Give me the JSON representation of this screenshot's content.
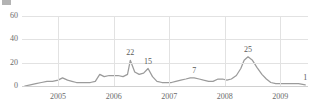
{
  "legend": {
    "label": "",
    "swatch_color": "#9a9a9a"
  },
  "chart_data": {
    "type": "line",
    "title": "",
    "subtitle": "",
    "xlabel": "",
    "ylabel": "",
    "grid": true,
    "legend_position": "top-left",
    "line_color": "#9b9b9b",
    "grid_color": "#e2e2e2",
    "background_color": "#ffffff",
    "ylim": [
      0,
      60
    ],
    "yticks": [
      0,
      20,
      40,
      60
    ],
    "ytick_labels": [
      "0",
      "20",
      "40",
      "60"
    ],
    "xlim": [
      2004.35,
      2009.5
    ],
    "xticks": [
      2005,
      2006,
      2007,
      2008,
      2009
    ],
    "xtick_labels": [
      "2005",
      "2006",
      "2007",
      "2008",
      "2009"
    ],
    "annotations": [
      {
        "label": "22",
        "x": 2006.3,
        "y": 22
      },
      {
        "label": "15",
        "x": 2006.62,
        "y": 15
      },
      {
        "label": "7",
        "x": 2007.45,
        "y": 7
      },
      {
        "label": "25",
        "x": 2008.42,
        "y": 25
      },
      {
        "label": "1",
        "x": 2009.45,
        "y": 1
      }
    ],
    "series": [
      {
        "name": "",
        "color": "#9b9b9b",
        "x": [
          2004.4,
          2004.5,
          2004.6,
          2004.7,
          2004.8,
          2004.9,
          2005.0,
          2005.08,
          2005.17,
          2005.25,
          2005.33,
          2005.42,
          2005.5,
          2005.58,
          2005.67,
          2005.75,
          2005.83,
          2005.92,
          2006.0,
          2006.08,
          2006.17,
          2006.25,
          2006.3,
          2006.38,
          2006.46,
          2006.54,
          2006.62,
          2006.7,
          2006.78,
          2006.87,
          2006.95,
          2007.04,
          2007.12,
          2007.21,
          2007.3,
          2007.38,
          2007.45,
          2007.54,
          2007.62,
          2007.71,
          2007.79,
          2007.88,
          2007.96,
          2008.04,
          2008.12,
          2008.21,
          2008.29,
          2008.35,
          2008.42,
          2008.5,
          2008.58,
          2008.67,
          2008.75,
          2008.83,
          2008.92,
          2009.0,
          2009.08,
          2009.17,
          2009.25,
          2009.33,
          2009.45
        ],
        "y": [
          0,
          1,
          2,
          3,
          4,
          4,
          5,
          7,
          5,
          4,
          3,
          3,
          3,
          3,
          4,
          10,
          8,
          9,
          9,
          9,
          8,
          10,
          22,
          12,
          10,
          11,
          15,
          8,
          4,
          3,
          3,
          3,
          4,
          5,
          6,
          7,
          7,
          6,
          5,
          4,
          4,
          6,
          6,
          5,
          6,
          9,
          15,
          22,
          25,
          22,
          16,
          10,
          6,
          3,
          2,
          2,
          2,
          2,
          2,
          2,
          1
        ]
      }
    ]
  }
}
